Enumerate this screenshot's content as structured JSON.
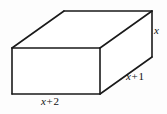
{
  "figure": {
    "name": "rectangular-prism",
    "background_color": "#fdfdfd",
    "stroke_color": "#1a1a1a",
    "fill_color": "#ffffff",
    "stroke_width": 1.6
  },
  "labels": {
    "height": {
      "text": "x",
      "var": "x",
      "op": "",
      "num": "",
      "edge": "right-vertical-edge"
    },
    "depth": {
      "text": "x + 1",
      "var": "x",
      "op": "+",
      "num": "1",
      "edge": "bottom-right-diagonal-edge"
    },
    "width": {
      "text": "x + 2",
      "var": "x",
      "op": "+",
      "num": "2",
      "edge": "bottom-front-edge"
    }
  },
  "geometry": {
    "front_face": {
      "points": "12,48 100,48 100,94 12,94",
      "name": "front-face"
    },
    "top_face": {
      "points": "12,48 64,11 152,11 100,48",
      "name": "top-face"
    },
    "right_face": {
      "points": "100,48 152,11 152,57 100,94",
      "name": "right-face"
    },
    "edges": [
      {
        "name": "front-top-edge",
        "x1": 12,
        "y1": 48,
        "x2": 100,
        "y2": 48
      },
      {
        "name": "front-bottom-edge",
        "x1": 12,
        "y1": 94,
        "x2": 100,
        "y2": 94
      },
      {
        "name": "front-left-edge",
        "x1": 12,
        "y1": 48,
        "x2": 12,
        "y2": 94
      },
      {
        "name": "front-right-edge",
        "x1": 100,
        "y1": 48,
        "x2": 100,
        "y2": 94
      },
      {
        "name": "top-back-edge",
        "x1": 64,
        "y1": 11,
        "x2": 152,
        "y2": 11
      },
      {
        "name": "top-left-diagonal-edge",
        "x1": 12,
        "y1": 48,
        "x2": 64,
        "y2": 11
      },
      {
        "name": "top-right-diagonal-edge",
        "x1": 100,
        "y1": 48,
        "x2": 152,
        "y2": 11
      },
      {
        "name": "back-right-vertical-edge",
        "x1": 152,
        "y1": 11,
        "x2": 152,
        "y2": 57
      },
      {
        "name": "bottom-right-diagonal-edge",
        "x1": 100,
        "y1": 94,
        "x2": 152,
        "y2": 57
      }
    ]
  }
}
